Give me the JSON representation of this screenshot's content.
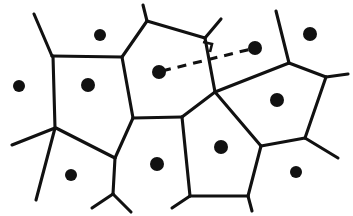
{
  "figure": {
    "type": "diagram",
    "background_color": "#ffffff",
    "ink_color": "#111111",
    "width": 353,
    "height": 216
  },
  "chart_data": {
    "type": "diagram",
    "xlabel": "",
    "ylabel": "",
    "xlim": [
      0,
      353
    ],
    "ylim": [
      0,
      216
    ],
    "grid": false,
    "legend": "none",
    "sites": [
      {
        "id": "site-top-left",
        "x": 100,
        "y": 35,
        "r": 6
      },
      {
        "id": "site-left-outer",
        "x": 19,
        "y": 86,
        "r": 6
      },
      {
        "id": "site-left-cell",
        "x": 88,
        "y": 85,
        "r": 7
      },
      {
        "id": "site-pair-left",
        "x": 159,
        "y": 72,
        "r": 7
      },
      {
        "id": "site-pair-right",
        "x": 255,
        "y": 48,
        "r": 7
      },
      {
        "id": "site-top-right",
        "x": 310,
        "y": 34,
        "r": 7
      },
      {
        "id": "site-right-cell",
        "x": 277,
        "y": 100,
        "r": 7
      },
      {
        "id": "site-center-bottom",
        "x": 221,
        "y": 147,
        "r": 7
      },
      {
        "id": "site-bottom-mid",
        "x": 157,
        "y": 164,
        "r": 7
      },
      {
        "id": "site-bottom-left",
        "x": 71,
        "y": 175,
        "r": 6
      },
      {
        "id": "site-bottom-right",
        "x": 296,
        "y": 172,
        "r": 6
      }
    ],
    "edges": [
      {
        "id": "edge-upper-left-stub",
        "points": [
          [
            34,
            14
          ],
          [
            52,
            56
          ]
        ]
      },
      {
        "id": "edge-left-horizontal",
        "points": [
          [
            52,
            56
          ],
          [
            122,
            57
          ]
        ]
      },
      {
        "id": "edge-left-vertical",
        "points": [
          [
            53,
            56
          ],
          [
            55,
            128
          ]
        ]
      },
      {
        "id": "edge-left-outer-stub",
        "points": [
          [
            55,
            128
          ],
          [
            12,
            145
          ]
        ]
      },
      {
        "id": "edge-left-down",
        "points": [
          [
            55,
            128
          ],
          [
            36,
            200
          ]
        ]
      },
      {
        "id": "edge-left-to-bottom-junction",
        "points": [
          [
            56,
            128
          ],
          [
            115,
            158
          ]
        ]
      },
      {
        "id": "edge-bottom-left-y",
        "points": [
          [
            115,
            158
          ],
          [
            113,
            194
          ]
        ]
      },
      {
        "id": "edge-bottom-y-left-stub",
        "points": [
          [
            113,
            194
          ],
          [
            92,
            208
          ]
        ]
      },
      {
        "id": "edge-bottom-y-right-stub",
        "points": [
          [
            113,
            194
          ],
          [
            131,
            212
          ]
        ]
      },
      {
        "id": "edge-left-cell-right",
        "points": [
          [
            122,
            57
          ],
          [
            133,
            118
          ]
        ]
      },
      {
        "id": "edge-mid-horizontal",
        "points": [
          [
            115,
            158
          ],
          [
            133,
            118
          ]
        ]
      },
      {
        "id": "edge-mid-cross",
        "points": [
          [
            133,
            118
          ],
          [
            182,
            117
          ]
        ]
      },
      {
        "id": "edge-top-left-diagonal",
        "points": [
          [
            122,
            57
          ],
          [
            147,
            21
          ]
        ]
      },
      {
        "id": "edge-top-spur",
        "points": [
          [
            147,
            21
          ],
          [
            143,
            5
          ]
        ]
      },
      {
        "id": "edge-top-span",
        "points": [
          [
            147,
            21
          ],
          [
            205,
            38
          ]
        ]
      },
      {
        "id": "edge-top-right-spur",
        "points": [
          [
            205,
            38
          ],
          [
            221,
            19
          ]
        ]
      },
      {
        "id": "edge-top-down-to-center",
        "points": [
          [
            205,
            38
          ],
          [
            215,
            92
          ]
        ]
      },
      {
        "id": "edge-center-to-mid",
        "points": [
          [
            215,
            92
          ],
          [
            182,
            117
          ]
        ]
      },
      {
        "id": "edge-mid-down",
        "points": [
          [
            182,
            117
          ],
          [
            190,
            196
          ]
        ]
      },
      {
        "id": "edge-bottom-left-stub2",
        "points": [
          [
            190,
            196
          ],
          [
            172,
            208
          ]
        ]
      },
      {
        "id": "edge-bottom-horizontal",
        "points": [
          [
            190,
            196
          ],
          [
            248,
            196
          ]
        ]
      },
      {
        "id": "edge-bottom-right-stub",
        "points": [
          [
            248,
            196
          ],
          [
            252,
            211
          ]
        ]
      },
      {
        "id": "edge-bottom-up-right",
        "points": [
          [
            248,
            196
          ],
          [
            261,
            146
          ]
        ]
      },
      {
        "id": "edge-center-down-right",
        "points": [
          [
            215,
            92
          ],
          [
            261,
            146
          ]
        ]
      },
      {
        "id": "edge-center-up-right",
        "points": [
          [
            215,
            92
          ],
          [
            289,
            63
          ]
        ]
      },
      {
        "id": "edge-right-top-spur",
        "points": [
          [
            289,
            63
          ],
          [
            276,
            11
          ]
        ]
      },
      {
        "id": "edge-right-upper",
        "points": [
          [
            289,
            63
          ],
          [
            326,
            77
          ]
        ]
      },
      {
        "id": "edge-right-lower",
        "points": [
          [
            326,
            77
          ],
          [
            305,
            138
          ]
        ]
      },
      {
        "id": "edge-right-to-bottom",
        "points": [
          [
            305,
            138
          ],
          [
            261,
            146
          ]
        ]
      },
      {
        "id": "edge-right-outer-stub",
        "points": [
          [
            326,
            77
          ],
          [
            348,
            74
          ]
        ]
      },
      {
        "id": "edge-right-down-stub",
        "points": [
          [
            305,
            138
          ],
          [
            338,
            158
          ]
        ]
      }
    ],
    "annotations": [
      {
        "id": "dashed-bisector-segment",
        "label": "dashed segment joining two sites",
        "style": "dashed",
        "from": [
          162,
          71
        ],
        "to": [
          251,
          49
        ]
      },
      {
        "id": "perpendicular-mark",
        "label": "right angle mark",
        "x": 203,
        "y": 42,
        "size": 9
      }
    ]
  }
}
